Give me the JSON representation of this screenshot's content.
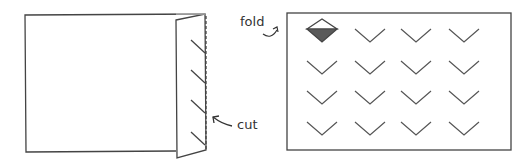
{
  "diagram": {
    "left_panel": {
      "description": "paper folded with right flap, slanted cuts along fold",
      "cut_marks": 4
    },
    "right_panel": {
      "description": "unfolded paper showing 4x4 grid of V-shaped cuts",
      "rows": 4,
      "cols": 4,
      "highlighted_cell": "row 1, col 1 (folded diamond)"
    },
    "labels": {
      "cut": "cut",
      "fold": "fold"
    },
    "colors": {
      "line": "#444444",
      "diamond_fill": "#5a5a5a"
    }
  }
}
